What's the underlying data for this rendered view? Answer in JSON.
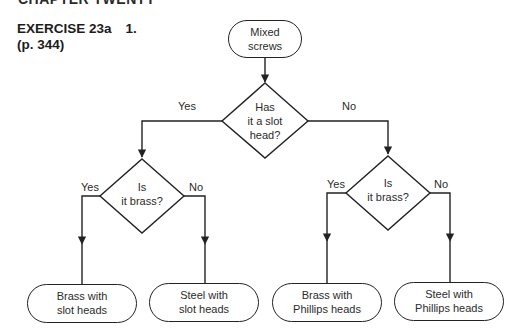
{
  "header": {
    "cut_off_heading": "CHAPTER TWENTY",
    "exercise_title": "EXERCISE 23a",
    "exercise_number": "1.",
    "page_ref": "(p. 344)"
  },
  "flowchart": {
    "start": {
      "line1": "Mixed",
      "line2": "screws"
    },
    "decision_main": {
      "line1": "Has",
      "line2": "it a slot",
      "line3": "head?"
    },
    "main_yes_label": "Yes",
    "main_no_label": "No",
    "decision_left": {
      "line1": "Is",
      "line2": "it brass?"
    },
    "left_yes_label": "Yes",
    "left_no_label": "No",
    "decision_right": {
      "line1": "Is",
      "line2": "it brass?"
    },
    "right_yes_label": "Yes",
    "right_no_label": "No",
    "outcomes": [
      {
        "line1": "Brass with",
        "line2": "slot heads"
      },
      {
        "line1": "Steel with",
        "line2": "slot heads"
      },
      {
        "line1": "Brass with",
        "line2": "Phillips heads"
      },
      {
        "line1": "Steel with",
        "line2": "Phillips heads"
      }
    ],
    "colors": {
      "line": "#222222",
      "text": "#2b2b2b",
      "background": "#ffffff"
    }
  }
}
